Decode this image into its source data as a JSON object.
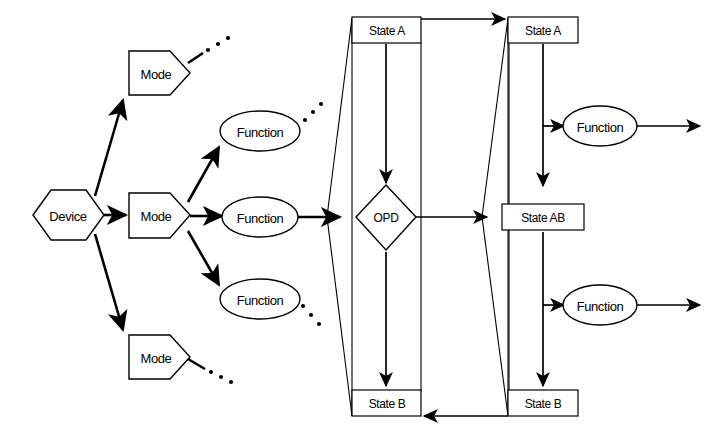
{
  "diagram": {
    "canvas": {
      "width": 709,
      "height": 437
    },
    "colors": {
      "stroke": "#000000",
      "fill": "#ffffff",
      "background": "#ffffff"
    },
    "nodes": {
      "device": {
        "label": "Device",
        "shape": "hexagon",
        "x": 68,
        "y": 215
      },
      "mode_top": {
        "label": "Mode",
        "shape": "pentagon",
        "x": 158,
        "y": 73
      },
      "mode_middle": {
        "label": "Mode",
        "shape": "pentagon",
        "x": 158,
        "y": 215
      },
      "mode_bottom": {
        "label": "Mode",
        "shape": "pentagon",
        "x": 158,
        "y": 357
      },
      "function_upper_left": {
        "label": "Function",
        "shape": "ellipse",
        "x": 260,
        "y": 131
      },
      "function_middle_left": {
        "label": "Function",
        "shape": "ellipse",
        "x": 260,
        "y": 217
      },
      "function_lower_left": {
        "label": "Function",
        "shape": "ellipse",
        "x": 260,
        "y": 299
      },
      "state_a_left": {
        "label": "State A",
        "shape": "rect",
        "x": 386,
        "y": 30
      },
      "opd": {
        "label": "OPD",
        "shape": "diamond",
        "x": 386,
        "y": 217
      },
      "state_b_left": {
        "label": "State B",
        "shape": "rect",
        "x": 386,
        "y": 403
      },
      "state_a_right": {
        "label": "State A",
        "shape": "rect",
        "x": 543,
        "y": 30
      },
      "state_ab_right": {
        "label": "State AB",
        "shape": "rect",
        "x": 543,
        "y": 217
      },
      "state_b_right": {
        "label": "State B",
        "shape": "rect",
        "x": 543,
        "y": 403
      },
      "function_upper_right": {
        "label": "Function",
        "shape": "ellipse",
        "x": 600,
        "y": 126
      },
      "function_lower_right": {
        "label": "Function",
        "shape": "ellipse",
        "x": 600,
        "y": 305
      }
    },
    "ellipsis_groups": [
      {
        "name": "ellipsis-mode-top",
        "dots": 3
      },
      {
        "name": "ellipsis-function-upper-left",
        "dots": 3
      },
      {
        "name": "ellipsis-function-lower-left",
        "dots": 3
      },
      {
        "name": "ellipsis-mode-bottom",
        "dots": 3
      }
    ],
    "edges": [
      {
        "name": "device-to-mode-top",
        "from": "device",
        "to": "mode_top",
        "arrow": true
      },
      {
        "name": "device-to-mode-middle",
        "from": "device",
        "to": "mode_middle",
        "arrow": true
      },
      {
        "name": "device-to-mode-bottom",
        "from": "device",
        "to": "mode_bottom",
        "arrow": true
      },
      {
        "name": "mode-to-function-upper",
        "from": "mode_middle",
        "to": "function_upper_left",
        "arrow": true
      },
      {
        "name": "mode-to-function-middle",
        "from": "mode_middle",
        "to": "function_middle_left",
        "arrow": true
      },
      {
        "name": "mode-to-function-lower",
        "from": "mode_middle",
        "to": "function_lower_left",
        "arrow": true
      },
      {
        "name": "function-to-opd",
        "from": "function_middle_left",
        "to": "opd",
        "arrow": true
      },
      {
        "name": "state-a-left-to-opd",
        "from": "state_a_left",
        "to": "opd",
        "arrow": true
      },
      {
        "name": "opd-to-state-b-left",
        "from": "opd",
        "to": "state_b_left",
        "arrow": true
      },
      {
        "name": "opd-to-state-ab",
        "from": "opd",
        "to": "state_ab_right",
        "arrow": true
      },
      {
        "name": "state-a-left-to-state-a-right",
        "from": "state_a_left",
        "to": "state_a_right",
        "arrow": true
      },
      {
        "name": "state-a-right-to-function-upper-right",
        "from": "state_a_right",
        "to": "function_upper_right",
        "arrow": true
      },
      {
        "name": "state-a-right-to-state-ab",
        "from": "state_a_right",
        "to": "state_ab_right",
        "arrow": true
      },
      {
        "name": "function-upper-right-out",
        "from": "function_upper_right",
        "to": "edge",
        "arrow": true
      },
      {
        "name": "state-ab-to-function-lower-right",
        "from": "state_ab_right",
        "to": "function_lower_right",
        "arrow": true
      },
      {
        "name": "state-ab-to-state-b-right",
        "from": "state_ab_right",
        "to": "state_b_right",
        "arrow": true
      },
      {
        "name": "function-lower-right-out",
        "from": "function_lower_right",
        "to": "edge",
        "arrow": true
      },
      {
        "name": "state-b-right-to-state-b-left",
        "from": "state_b_right",
        "to": "state_b_left",
        "arrow": true
      }
    ]
  }
}
